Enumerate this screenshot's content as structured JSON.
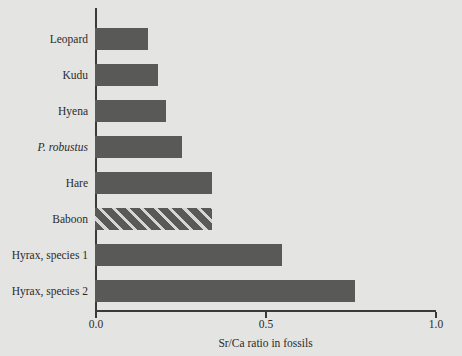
{
  "chart_data": {
    "type": "bar",
    "orientation": "horizontal",
    "title": "",
    "xlabel": "Sr/Ca ratio in fossils",
    "ylabel": "",
    "xlim": [
      0.0,
      1.0
    ],
    "xticks": [
      0.0,
      0.5,
      1.0
    ],
    "xtick_labels": [
      "0.0",
      "0.5",
      "1.0"
    ],
    "grid": false,
    "legend": null,
    "categories": [
      "Leopard",
      "Kudu",
      "Hyena",
      "P. robustus",
      "Hare",
      "Baboon",
      "Hyrax, species 1",
      "Hyrax, species 2"
    ],
    "values": [
      0.155,
      0.185,
      0.21,
      0.255,
      0.345,
      0.345,
      0.55,
      0.765
    ],
    "bars": [
      {
        "label": "Leopard",
        "value": 0.155,
        "italic": false,
        "pattern": "solid"
      },
      {
        "label": "Kudu",
        "value": 0.185,
        "italic": false,
        "pattern": "solid"
      },
      {
        "label": "Hyena",
        "value": 0.21,
        "italic": false,
        "pattern": "solid"
      },
      {
        "label": "P. robustus",
        "value": 0.255,
        "italic": true,
        "pattern": "solid"
      },
      {
        "label": "Hare",
        "value": 0.345,
        "italic": false,
        "pattern": "solid"
      },
      {
        "label": "Baboon",
        "value": 0.345,
        "italic": false,
        "pattern": "diagonal-hatch"
      },
      {
        "label": "Hyrax, species 1",
        "value": 0.55,
        "italic": false,
        "pattern": "solid"
      },
      {
        "label": "Hyrax, species 2",
        "value": 0.765,
        "italic": false,
        "pattern": "solid"
      }
    ],
    "colors": {
      "background": "#e4e4e2",
      "bar_fill": "#595957",
      "hatch_stripe": "#d6d6d2",
      "axis": "#3a3a38",
      "text": "#2b2b29"
    }
  }
}
